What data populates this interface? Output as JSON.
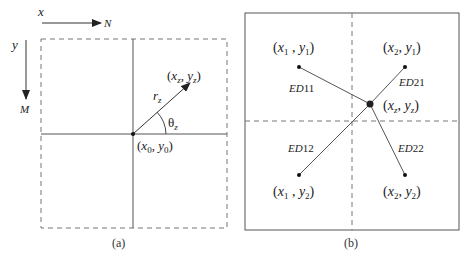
{
  "figure": {
    "colors": {
      "line": "#555555",
      "dashed": "#777777",
      "text": "#222222"
    },
    "panel_a": {
      "caption": "(a)",
      "x_axis": {
        "label": "x",
        "arrow_label": "N"
      },
      "y_axis": {
        "label": "y",
        "arrow_label": "M"
      },
      "origin_label": {
        "open": "(",
        "x": "x",
        "x_sub": "0",
        "sep": ", ",
        "y": "y",
        "y_sub": "0",
        "close": ")"
      },
      "point_label": {
        "open": "(",
        "x": "x",
        "x_sub": "z",
        "sep": ", ",
        "y": "y",
        "y_sub": "z",
        "close": ")"
      },
      "radius_label": {
        "base": "r",
        "sub": "z"
      },
      "angle_label": {
        "base": "θ",
        "sub": "z"
      }
    },
    "panel_b": {
      "caption": "(b)",
      "points": [
        {
          "id": "p11",
          "open": "(",
          "x": "x",
          "x_sub": "1",
          "sep": " , ",
          "y": "y",
          "y_sub": "1",
          "close": ")"
        },
        {
          "id": "p21",
          "open": "(",
          "x": "x",
          "x_sub": "2",
          "sep": ", ",
          "y": "y",
          "y_sub": "1",
          "close": ")"
        },
        {
          "id": "p12",
          "open": "(",
          "x": "x",
          "x_sub": "1",
          "sep": " , ",
          "y": "y",
          "y_sub": "2",
          "close": ")"
        },
        {
          "id": "p22",
          "open": "(",
          "x": "x",
          "x_sub": "2",
          "sep": ", ",
          "y": "y",
          "y_sub": "2",
          "close": ")"
        }
      ],
      "center": {
        "open": "(",
        "x": "x",
        "x_sub": "z",
        "sep": ", ",
        "y": "y",
        "y_sub": "z",
        "close": ")"
      },
      "distances": [
        {
          "ed": "ED",
          "num": "11"
        },
        {
          "ed": "ED",
          "num": "21"
        },
        {
          "ed": "ED",
          "num": "12"
        },
        {
          "ed": "ED",
          "num": "22"
        }
      ]
    }
  }
}
